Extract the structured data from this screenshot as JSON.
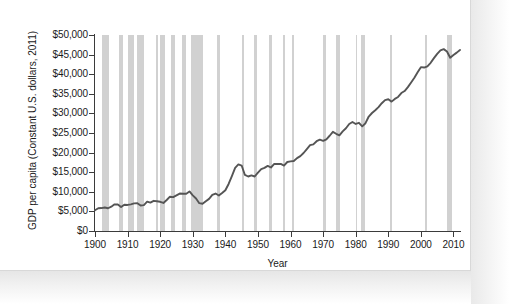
{
  "chart_data": {
    "type": "line",
    "title": "",
    "xlabel": "Year",
    "ylabel": "GDP per capita (Constant U.S. dollars, 2011)",
    "xlim": [
      1900,
      2012
    ],
    "ylim": [
      0,
      50000
    ],
    "grid": false,
    "legend": "none",
    "x_ticks": [
      "1900",
      "1910",
      "1920",
      "1930",
      "1940",
      "1950",
      "1960",
      "1970",
      "1980",
      "1990",
      "2000",
      "2010"
    ],
    "x_tick_values": [
      1900,
      1910,
      1920,
      1930,
      1940,
      1950,
      1960,
      1970,
      1980,
      1990,
      2000,
      2010
    ],
    "y_ticks": [
      "$0",
      "$5,000",
      "$10,000",
      "$15,000",
      "$20,000",
      "$25,000",
      "$30,000",
      "$35,000",
      "$40,000",
      "$45,000",
      "$50,000"
    ],
    "y_tick_values": [
      0,
      5000,
      10000,
      15000,
      20000,
      25000,
      30000,
      35000,
      40000,
      45000,
      50000
    ],
    "line_color": "#555555",
    "band_color": "#c9c9c9",
    "series": [
      {
        "name": "GDP per capita",
        "x": [
          1900,
          1901,
          1902,
          1903,
          1904,
          1905,
          1906,
          1907,
          1908,
          1909,
          1910,
          1911,
          1912,
          1913,
          1914,
          1915,
          1916,
          1917,
          1918,
          1919,
          1920,
          1921,
          1922,
          1923,
          1924,
          1925,
          1926,
          1927,
          1928,
          1929,
          1930,
          1931,
          1932,
          1933,
          1934,
          1935,
          1936,
          1937,
          1938,
          1939,
          1940,
          1941,
          1942,
          1943,
          1944,
          1945,
          1946,
          1947,
          1948,
          1949,
          1950,
          1951,
          1952,
          1953,
          1954,
          1955,
          1956,
          1957,
          1958,
          1959,
          1960,
          1961,
          1962,
          1963,
          1964,
          1965,
          1966,
          1967,
          1968,
          1969,
          1970,
          1971,
          1972,
          1973,
          1974,
          1975,
          1976,
          1977,
          1978,
          1979,
          1980,
          1981,
          1982,
          1983,
          1984,
          1985,
          1986,
          1987,
          1988,
          1989,
          1990,
          1991,
          1992,
          1993,
          1994,
          1995,
          1996,
          1997,
          1998,
          1999,
          2000,
          2001,
          2002,
          2003,
          2004,
          2005,
          2006,
          2007,
          2008,
          2009,
          2010,
          2011,
          2012
        ],
        "values": [
          5300,
          5800,
          5850,
          6000,
          5800,
          6200,
          6800,
          6750,
          6100,
          6700,
          6650,
          6800,
          7050,
          7100,
          6500,
          6600,
          7500,
          7250,
          7700,
          7600,
          7450,
          7150,
          7900,
          8750,
          8650,
          9100,
          9550,
          9500,
          9500,
          10100,
          9100,
          8300,
          7100,
          6950,
          7600,
          8200,
          9200,
          9550,
          9050,
          9700,
          10400,
          12000,
          14000,
          16100,
          17000,
          16700,
          14300,
          13900,
          14200,
          13900,
          14900,
          15800,
          16100,
          16600,
          16200,
          17100,
          17100,
          17100,
          16700,
          17600,
          17750,
          17850,
          18600,
          19100,
          19900,
          20900,
          21900,
          22100,
          22900,
          23300,
          23000,
          23400,
          24300,
          25300,
          24800,
          24400,
          25400,
          26200,
          27300,
          27800,
          27300,
          27600,
          26700,
          27500,
          29200,
          30100,
          30800,
          31600,
          32600,
          33400,
          33600,
          33000,
          33700,
          34200,
          35200,
          35700,
          36700,
          37900,
          39100,
          40500,
          41800,
          41700,
          42000,
          42900,
          44100,
          45200,
          46100,
          46400,
          45800,
          44200,
          44900,
          45500,
          46200
        ]
      }
    ],
    "recession_bands": [
      {
        "start": 1902.2,
        "end": 1904.3
      },
      {
        "start": 1907.4,
        "end": 1908.5
      },
      {
        "start": 1910.0,
        "end": 1912.0
      },
      {
        "start": 1913.0,
        "end": 1914.9
      },
      {
        "start": 1918.6,
        "end": 1919.2
      },
      {
        "start": 1920.0,
        "end": 1921.5
      },
      {
        "start": 1923.3,
        "end": 1924.5
      },
      {
        "start": 1926.7,
        "end": 1927.9
      },
      {
        "start": 1929.6,
        "end": 1933.2
      },
      {
        "start": 1937.4,
        "end": 1938.5
      },
      {
        "start": 1945.1,
        "end": 1945.7
      },
      {
        "start": 1948.8,
        "end": 1949.8
      },
      {
        "start": 1953.5,
        "end": 1954.4
      },
      {
        "start": 1957.6,
        "end": 1958.3
      },
      {
        "start": 1960.3,
        "end": 1961.1
      },
      {
        "start": 1969.9,
        "end": 1970.9
      },
      {
        "start": 1973.9,
        "end": 1975.2
      },
      {
        "start": 1980.0,
        "end": 1980.5
      },
      {
        "start": 1981.5,
        "end": 1982.9
      },
      {
        "start": 1990.6,
        "end": 1991.2
      },
      {
        "start": 2001.2,
        "end": 2001.9
      },
      {
        "start": 2007.9,
        "end": 2009.5
      }
    ]
  }
}
